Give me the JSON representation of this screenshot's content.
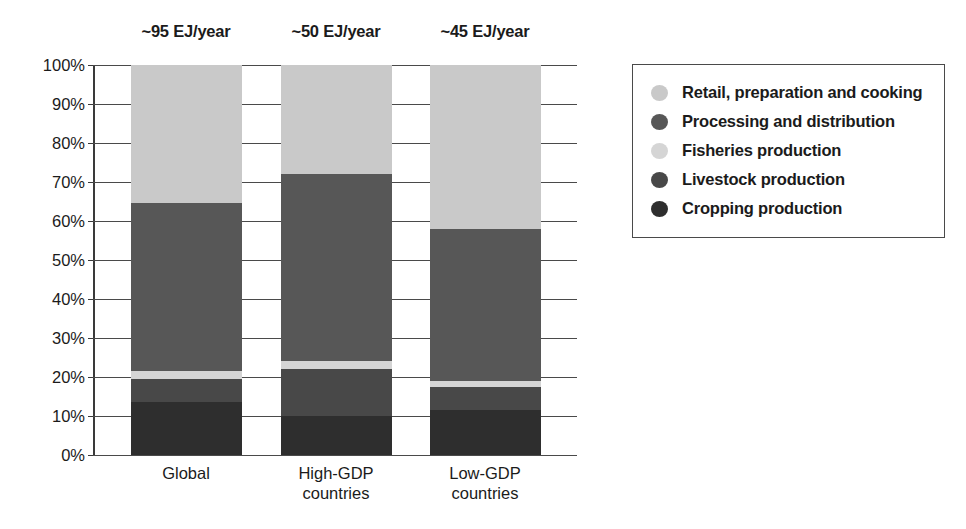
{
  "chart_data": {
    "type": "bar",
    "title": "",
    "subtitle": "",
    "xlabel": "",
    "ylabel": "",
    "ylim": [
      0,
      100
    ],
    "y_tick_labels": [
      "100%",
      "90%",
      "80%",
      "70%",
      "60%",
      "50%",
      "40%",
      "30%",
      "20%",
      "10%",
      "0%"
    ],
    "y_tick_values": [
      100,
      90,
      80,
      70,
      60,
      50,
      40,
      30,
      20,
      10,
      0
    ],
    "grid": true,
    "stacked": true,
    "stack_total": 100,
    "legend_position": "right",
    "categories": [
      "Global",
      "High-GDP countries",
      "Low-GDP countries"
    ],
    "category_lines": [
      [
        "Global"
      ],
      [
        "High-GDP",
        "countries"
      ],
      [
        "Low-GDP",
        "countries"
      ]
    ],
    "annotations": [
      "~95 EJ/year",
      "~50 EJ/year",
      "~45 EJ/year"
    ],
    "series": [
      {
        "name": "Retail, preparation and cooking",
        "color": "#c9c9c9",
        "values": [
          35.5,
          28.0,
          42.0
        ]
      },
      {
        "name": "Processing and distribution",
        "color": "#575757",
        "values": [
          43.0,
          48.0,
          39.0
        ]
      },
      {
        "name": "Fisheries production",
        "color": "#d5d5d5",
        "values": [
          2.0,
          2.0,
          1.5
        ]
      },
      {
        "name": "Livestock production",
        "color": "#484848",
        "values": [
          6.0,
          12.0,
          6.0
        ]
      },
      {
        "name": "Cropping production",
        "color": "#2e2e2e",
        "values": [
          13.5,
          10.0,
          11.5
        ]
      }
    ],
    "stack_order_bottom_up": [
      "Cropping production",
      "Livestock production",
      "Fisheries production",
      "Processing and distribution",
      "Retail, preparation and cooking"
    ]
  },
  "legend": {
    "items": [
      {
        "label": "Retail, preparation and cooking",
        "color": "#c9c9c9"
      },
      {
        "label": "Processing and distribution",
        "color": "#575757"
      },
      {
        "label": "Fisheries production",
        "color": "#d5d5d5"
      },
      {
        "label": "Livestock production",
        "color": "#484848"
      },
      {
        "label": "Cropping production",
        "color": "#2e2e2e"
      }
    ]
  }
}
